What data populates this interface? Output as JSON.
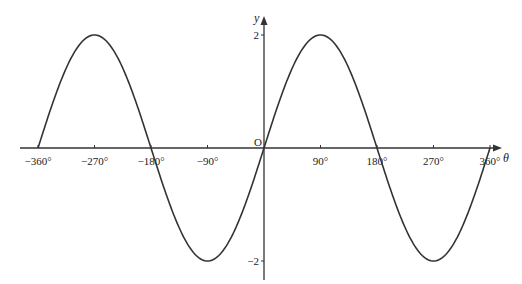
{
  "chart_data": {
    "type": "line",
    "title": "",
    "xlabel": "θ",
    "ylabel": "y",
    "origin_label": "O",
    "xlim": [
      -360,
      360
    ],
    "ylim": [
      -2,
      2
    ],
    "grid": false,
    "legend": null,
    "x_ticks": [
      -360,
      -270,
      -180,
      -90,
      90,
      180,
      270,
      360
    ],
    "x_tick_labels": [
      "−360°",
      "−270°",
      "−180°",
      "−90°",
      "90°",
      "180°",
      "270°",
      "360°"
    ],
    "y_ticks": [
      2,
      -2
    ],
    "y_tick_labels": [
      "2",
      "−2"
    ],
    "series": [
      {
        "name": "y = 2 sin θ",
        "x": [
          -360,
          -270,
          -180,
          -90,
          0,
          90,
          180,
          270,
          360
        ],
        "values": [
          0,
          2,
          0,
          -2,
          0,
          2,
          0,
          -2,
          0
        ]
      }
    ]
  }
}
